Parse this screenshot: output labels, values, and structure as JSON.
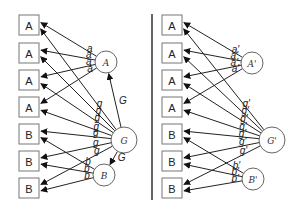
{
  "diagram": {
    "divider": {
      "x": 152,
      "y1": 14,
      "y2": 200
    },
    "panels": [
      {
        "id": "left",
        "boxes": [
          {
            "label": "A",
            "x": 19,
            "y": 15
          },
          {
            "label": "A",
            "x": 19,
            "y": 43
          },
          {
            "label": "A",
            "x": 19,
            "y": 70
          },
          {
            "label": "A",
            "x": 19,
            "y": 97
          },
          {
            "label": "B",
            "x": 19,
            "y": 124
          },
          {
            "label": "B",
            "x": 19,
            "y": 151
          },
          {
            "label": "B",
            "x": 19,
            "y": 178
          }
        ],
        "box_size": 20,
        "circles": [
          {
            "id": "A",
            "label": "A",
            "cx": 106,
            "cy": 62,
            "r": 11
          },
          {
            "id": "G",
            "label": "G",
            "cx": 124,
            "cy": 140,
            "r": 13
          },
          {
            "id": "B",
            "label": "B",
            "cx": 104,
            "cy": 175,
            "r": 11
          }
        ],
        "loading_labels": {
          "a": "a",
          "g": "g",
          "b": "b"
        },
        "extra_edges": [
          {
            "from": "G",
            "to": "A",
            "label": "G"
          },
          {
            "from": "G",
            "to": "B",
            "label": "G"
          }
        ]
      },
      {
        "id": "right",
        "boxes": [
          {
            "label": "A",
            "x": 162,
            "y": 15
          },
          {
            "label": "A",
            "x": 162,
            "y": 43
          },
          {
            "label": "A",
            "x": 162,
            "y": 70
          },
          {
            "label": "A",
            "x": 162,
            "y": 97
          },
          {
            "label": "B",
            "x": 162,
            "y": 124
          },
          {
            "label": "B",
            "x": 162,
            "y": 151
          },
          {
            "label": "B",
            "x": 162,
            "y": 178
          }
        ],
        "box_size": 20,
        "circles": [
          {
            "id": "A",
            "label": "A'",
            "cx": 252,
            "cy": 63,
            "r": 11
          },
          {
            "id": "G",
            "label": "G'",
            "cx": 272,
            "cy": 140,
            "r": 13
          },
          {
            "id": "B",
            "label": "B'",
            "cx": 253,
            "cy": 179,
            "r": 11
          }
        ],
        "loading_labels": {
          "a": "a'",
          "g": "g'",
          "b": "b'"
        },
        "extra_edges": []
      }
    ]
  }
}
